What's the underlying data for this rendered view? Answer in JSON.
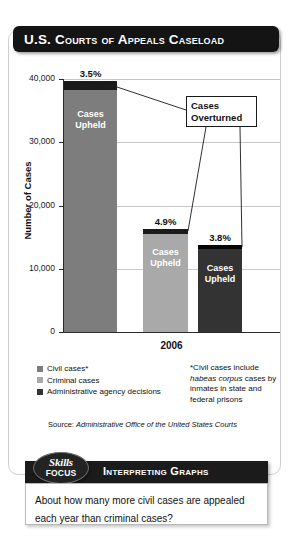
{
  "header": {
    "title": "U.S. Courts of Appeals Caseload"
  },
  "chart_data": {
    "type": "bar",
    "title": "U.S. Courts of Appeals Caseload",
    "xlabel": "2006",
    "ylabel": "Number of Cases",
    "ylim": [
      0,
      40000
    ],
    "ticks": [
      "0",
      "10,000",
      "20,000",
      "30,000",
      "40,000"
    ],
    "grid": true,
    "categories": [
      "Civil cases*",
      "Criminal cases",
      "Administrative agency decisions"
    ],
    "values": [
      39500,
      16200,
      13700
    ],
    "stacked_segments": {
      "upheld_label": "Cases Upheld",
      "overturned_label": "Cases Overturned",
      "overturned_percent": [
        "3.5%",
        "4.9%",
        "3.8%"
      ]
    },
    "series": [
      {
        "name": "Cases Upheld",
        "values": [
          38118,
          15406,
          13179
        ]
      },
      {
        "name": "Cases Overturned",
        "values": [
          1382,
          794,
          521
        ]
      }
    ],
    "colors": {
      "civil": "#7d7d7d",
      "criminal": "#a9a9a9",
      "administrative": "#333333",
      "overturned": "#1b1b1b",
      "gridline": "#c8c8c8",
      "axis": "#2b2b2b"
    },
    "legend_position": "below-left",
    "bar_labels": [
      "Cases Upheld",
      "Cases Upheld",
      "Cases Upheld"
    ]
  },
  "legend": {
    "items": [
      {
        "label": "Civil cases*",
        "color": "#7d7d7d"
      },
      {
        "label": "Criminal cases",
        "color": "#a9a9a9"
      },
      {
        "label": "Administrative agency decisions",
        "color": "#333333"
      }
    ]
  },
  "footnote": {
    "line1": "*Civil cases include",
    "italic": "habeas corpus",
    "line2": " cases",
    "line3": "by inmates in state",
    "line4": "and federal prisons"
  },
  "source": {
    "prefix": "Source: ",
    "name_line1": "Administrative Office of the",
    "name_line2": "United States Courts"
  },
  "skills_focus": {
    "badge_line1": "Skills",
    "badge_line2": "Focus",
    "bar_title": "Interpreting Graphs",
    "question": "About how many more civil cases are appealed each year than criminal cases?"
  }
}
